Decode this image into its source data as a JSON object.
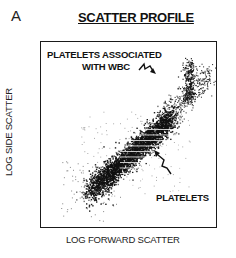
{
  "figure": {
    "panel_letter": "A",
    "title": "SCATTER PROFILE"
  },
  "chart_data": {
    "type": "scatter",
    "title": "SCATTER PROFILE",
    "xlabel": "LOG FORWARD SCATTER",
    "ylabel": "LOG SIDE SCATTER",
    "grid": false,
    "legend": null,
    "axis_ticks": "none (log scales, unlabeled)",
    "annotations": [
      {
        "text": "PLATELETS ASSOCIATED WITH WBC",
        "arrow_to": "upper-right sparse column of events"
      },
      {
        "text": "PLATELETS",
        "arrow_to": "main dense diagonal cloud"
      }
    ],
    "populations": [
      {
        "name": "PLATELETS",
        "shape": "dense diagonal band, lower-left to middle",
        "relative_x_center": 0.45,
        "relative_y_center": 0.55,
        "density": "high"
      },
      {
        "name": "PLATELETS ASSOCIATED WITH WBC",
        "shape": "vertical streak, upper right",
        "relative_x_center": 0.84,
        "relative_y_center": 0.2,
        "density": "medium"
      },
      {
        "name": "debris",
        "shape": "sparse scattered events lower-left",
        "relative_x_center": 0.2,
        "relative_y_center": 0.85,
        "density": "low"
      }
    ]
  },
  "annotations": {
    "wbc_line1": "PLATELETS ASSOCIATED",
    "wbc_line2": "WITH WBC",
    "platelets": "PLATELETS"
  },
  "axes": {
    "x_label": "LOG FORWARD SCATTER",
    "y_label": "LOG SIDE SCATTER"
  }
}
